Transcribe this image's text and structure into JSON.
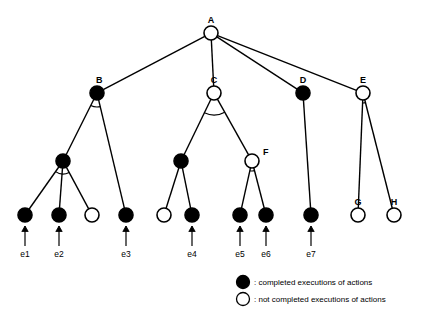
{
  "diagram": {
    "type": "and-or-task-tree",
    "nodes": [
      {
        "id": "A",
        "label": "A",
        "x": 211,
        "y": 33,
        "filled": false,
        "label_dx": 0,
        "label_dy": -10
      },
      {
        "id": "B",
        "label": "B",
        "x": 97,
        "y": 93,
        "filled": true,
        "label_dx": -1,
        "label_dy": -10
      },
      {
        "id": "C",
        "label": "C",
        "x": 214,
        "y": 93,
        "filled": false,
        "label_dx": 0,
        "label_dy": -10
      },
      {
        "id": "D",
        "label": "D",
        "x": 303,
        "y": 93,
        "filled": true,
        "label_dx": 0,
        "label_dy": -10
      },
      {
        "id": "E",
        "label": "E",
        "x": 363,
        "y": 93,
        "filled": false,
        "label_dx": 0,
        "label_dy": -10
      },
      {
        "id": "B1",
        "label": "",
        "x": 63,
        "y": 161,
        "filled": true,
        "label_dx": 0,
        "label_dy": 0
      },
      {
        "id": "C1",
        "label": "",
        "x": 181,
        "y": 161,
        "filled": true,
        "label_dx": 0,
        "label_dy": 0
      },
      {
        "id": "F",
        "label": "F",
        "x": 252,
        "y": 161,
        "filled": false,
        "label_dx": 11,
        "label_dy": -6
      },
      {
        "id": "L1",
        "label": "",
        "x": 25,
        "y": 215,
        "filled": true,
        "label_dx": 0,
        "label_dy": 0
      },
      {
        "id": "L2",
        "label": "",
        "x": 59,
        "y": 215,
        "filled": true,
        "label_dx": 0,
        "label_dy": 0
      },
      {
        "id": "L3",
        "label": "",
        "x": 92,
        "y": 215,
        "filled": false,
        "label_dx": 0,
        "label_dy": 0
      },
      {
        "id": "L4",
        "label": "",
        "x": 126,
        "y": 215,
        "filled": true,
        "label_dx": 0,
        "label_dy": 0
      },
      {
        "id": "L5",
        "label": "",
        "x": 164,
        "y": 215,
        "filled": false,
        "label_dx": 0,
        "label_dy": 0
      },
      {
        "id": "L6",
        "label": "",
        "x": 192,
        "y": 215,
        "filled": true,
        "label_dx": 0,
        "label_dy": 0
      },
      {
        "id": "L7",
        "label": "",
        "x": 240,
        "y": 215,
        "filled": true,
        "label_dx": 0,
        "label_dy": 0
      },
      {
        "id": "L8",
        "label": "",
        "x": 266,
        "y": 215,
        "filled": true,
        "label_dx": 0,
        "label_dy": 0
      },
      {
        "id": "L9",
        "label": "",
        "x": 311,
        "y": 215,
        "filled": true,
        "label_dx": 0,
        "label_dy": 0
      },
      {
        "id": "G",
        "label": "G",
        "x": 358,
        "y": 215,
        "filled": false,
        "label_dx": 0,
        "label_dy": -10
      },
      {
        "id": "H",
        "label": "H",
        "x": 394,
        "y": 215,
        "filled": false,
        "label_dx": 0,
        "label_dy": -10
      }
    ],
    "edges": [
      {
        "from": "A",
        "to": "B"
      },
      {
        "from": "A",
        "to": "C"
      },
      {
        "from": "A",
        "to": "D"
      },
      {
        "from": "A",
        "to": "E"
      },
      {
        "from": "B",
        "to": "B1"
      },
      {
        "from": "B",
        "to": "L4"
      },
      {
        "from": "C",
        "to": "C1"
      },
      {
        "from": "C",
        "to": "F"
      },
      {
        "from": "B1",
        "to": "L1"
      },
      {
        "from": "B1",
        "to": "L2"
      },
      {
        "from": "B1",
        "to": "L3"
      },
      {
        "from": "C1",
        "to": "L5"
      },
      {
        "from": "C1",
        "to": "L6"
      },
      {
        "from": "F",
        "to": "L7"
      },
      {
        "from": "F",
        "to": "L8"
      },
      {
        "from": "D",
        "to": "L9"
      },
      {
        "from": "E",
        "to": "G"
      },
      {
        "from": "E",
        "to": "H"
      }
    ],
    "and_arcs": [
      {
        "node": "B",
        "r": 14
      },
      {
        "node": "C",
        "r": 22
      },
      {
        "node": "B1",
        "r": 13
      },
      {
        "node": "F",
        "r": 10
      },
      {
        "node": "E",
        "r": 10
      }
    ],
    "leaf_arrows": [
      {
        "id": "e1",
        "label": "e1",
        "x": 25,
        "node": "L1"
      },
      {
        "id": "e2",
        "label": "e2",
        "x": 59,
        "node": "L2"
      },
      {
        "id": "e3",
        "label": "e3",
        "x": 126,
        "node": "L4"
      },
      {
        "id": "e4",
        "label": "e4",
        "x": 192,
        "node": "L6"
      },
      {
        "id": "e5",
        "label": "e5",
        "x": 240,
        "node": "L7"
      },
      {
        "id": "e6",
        "label": "e6",
        "x": 266,
        "node": "L8"
      },
      {
        "id": "e7",
        "label": "e7",
        "x": 311,
        "node": "L9"
      }
    ],
    "legend": {
      "filled": ": completed executions of actions",
      "open": ": not completed executions of actions"
    },
    "colors": {
      "stroke": "#000000",
      "filled_node": "#000000",
      "open_node": "#ffffff",
      "background": "#ffffff"
    }
  }
}
